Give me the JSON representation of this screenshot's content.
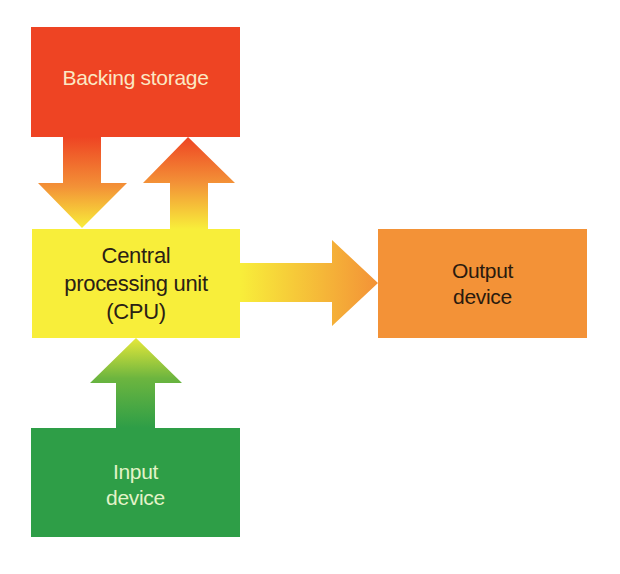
{
  "diagram": {
    "nodes": [
      {
        "id": "backing",
        "label": "Backing storage",
        "color": "#ee4423",
        "text_color": "#fbe8c4"
      },
      {
        "id": "cpu",
        "label": "Central\nprocessing unit\n(CPU)",
        "color": "#f8ee3a",
        "text_color": "#2a2015"
      },
      {
        "id": "output",
        "label": "Output\ndevice",
        "color": "#f39237",
        "text_color": "#2a1a0e"
      },
      {
        "id": "input",
        "label": "Input\ndevice",
        "color": "#2e9e47",
        "text_color": "#e3f3c8"
      }
    ],
    "edges": [
      {
        "from": "backing",
        "to": "cpu",
        "direction": "down"
      },
      {
        "from": "cpu",
        "to": "backing",
        "direction": "up"
      },
      {
        "from": "cpu",
        "to": "output",
        "direction": "right"
      },
      {
        "from": "input",
        "to": "cpu",
        "direction": "up"
      }
    ]
  }
}
